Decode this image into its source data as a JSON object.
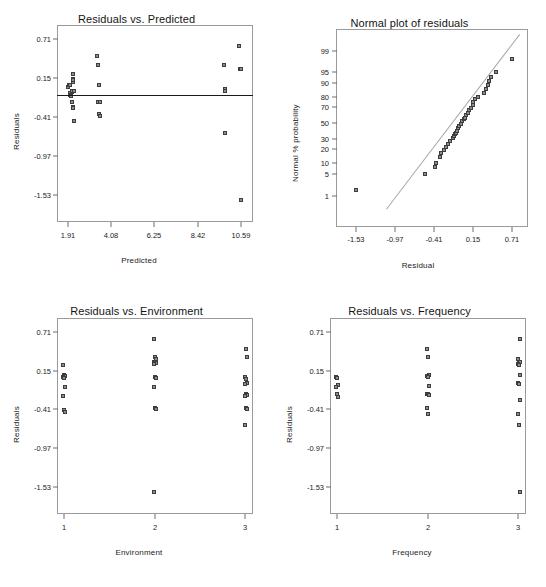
{
  "figure": {
    "width": 546,
    "height": 587,
    "background": "#ffffff",
    "marker_fill": "#8d8d8d",
    "marker_stroke": "#3d3d3d",
    "frame_color": "#9a9a9a",
    "zeroline_color": "#1a1a1a",
    "refline_color": "#a6a6a6"
  },
  "chart_data": [
    {
      "id": "residuals-vs-predicted",
      "type": "scatter",
      "title": "Residuals vs. Predicted",
      "xlabel": "Predicted",
      "ylabel": "Residuals",
      "xlim": [
        1.365,
        11.155
      ],
      "ylim": [
        -1.83,
        1.0
      ],
      "xticks": [
        1.91,
        4.08,
        6.25,
        8.42,
        10.59
      ],
      "xtick_labels": [
        "1.91",
        "4.08",
        "6.25",
        "8.42",
        "10.59"
      ],
      "yticks": [
        0.71,
        0.15,
        -0.41,
        -0.97,
        -1.53
      ],
      "ytick_labels": [
        "0.71",
        "0.15",
        "-0.41",
        "-0.97",
        "-1.53"
      ],
      "grid": false,
      "legend": null,
      "zero_reference_line": 0.0,
      "points": [
        [
          1.88,
          0.12
        ],
        [
          1.9,
          0.14
        ],
        [
          1.93,
          0.15
        ],
        [
          1.95,
          0.145
        ],
        [
          1.96,
          0.02
        ],
        [
          1.97,
          0.03
        ],
        [
          1.99,
          0.0
        ],
        [
          2.01,
          -0.02
        ],
        [
          2.05,
          0.04
        ],
        [
          2.07,
          0.05
        ],
        [
          2.1,
          0.3
        ],
        [
          2.12,
          0.19
        ],
        [
          2.13,
          0.23
        ],
        [
          2.14,
          0.21
        ],
        [
          2.15,
          0.05
        ],
        [
          2.18,
          0.06
        ],
        [
          2.05,
          -0.1
        ],
        [
          2.12,
          -0.18
        ],
        [
          2.14,
          -0.19
        ],
        [
          2.17,
          -0.38
        ],
        [
          3.35,
          0.56
        ],
        [
          3.38,
          0.44
        ],
        [
          3.42,
          0.15
        ],
        [
          3.4,
          -0.1
        ],
        [
          3.46,
          -0.1
        ],
        [
          3.48,
          -0.1
        ],
        [
          3.44,
          -0.27
        ],
        [
          3.46,
          -0.3
        ],
        [
          3.47,
          -0.31
        ],
        [
          9.75,
          0.44
        ],
        [
          9.78,
          0.09
        ],
        [
          9.8,
          0.06
        ],
        [
          9.78,
          -0.55
        ],
        [
          10.52,
          0.71
        ],
        [
          10.55,
          0.38
        ],
        [
          10.58,
          0.37
        ],
        [
          10.6,
          0.38
        ],
        [
          10.59,
          -1.53
        ]
      ]
    },
    {
      "id": "normal-plot-of-residuals",
      "type": "scatter",
      "title": "Normal plot of residuals",
      "xlabel": "Residual",
      "ylabel": "Normal % probability",
      "xlim": [
        -1.81,
        0.92
      ],
      "xticks": [
        -1.53,
        -0.97,
        -0.41,
        0.15,
        0.71
      ],
      "xtick_labels": [
        "-1.53",
        "-0.97",
        "-0.41",
        "0.15",
        "0.71"
      ],
      "yticks": [
        99,
        95,
        90,
        80,
        70,
        50,
        30,
        20,
        10,
        5,
        1
      ],
      "ytick_labels": [
        "99",
        "95",
        "90",
        "80",
        "70",
        "50",
        "30",
        "20",
        "10",
        "5",
        "1"
      ],
      "grid": false,
      "legend": null,
      "reference_line": {
        "x1": -1.1,
        "y1": 0.3,
        "x2": 0.82,
        "y2": 99.8
      },
      "points": [
        [
          -1.53,
          1.6
        ],
        [
          -0.55,
          5.0
        ],
        [
          -0.4,
          8.0
        ],
        [
          -0.39,
          10.0
        ],
        [
          -0.33,
          14.0
        ],
        [
          -0.31,
          16.5
        ],
        [
          -0.27,
          19.0
        ],
        [
          -0.25,
          22.0
        ],
        [
          -0.21,
          25.0
        ],
        [
          -0.19,
          28.0
        ],
        [
          -0.15,
          31.0
        ],
        [
          -0.13,
          34.0
        ],
        [
          -0.12,
          36.0
        ],
        [
          -0.1,
          38.0
        ],
        [
          -0.09,
          40.0
        ],
        [
          -0.07,
          43.0
        ],
        [
          -0.05,
          46.0
        ],
        [
          -0.03,
          49.0
        ],
        [
          -0.01,
          52.0
        ],
        [
          0.01,
          55.0
        ],
        [
          0.03,
          57.0
        ],
        [
          0.05,
          60.0
        ],
        [
          0.07,
          63.0
        ],
        [
          0.09,
          66.0
        ],
        [
          0.12,
          69.0
        ],
        [
          0.14,
          72.0
        ],
        [
          0.15,
          75.0
        ],
        [
          0.17,
          78.0
        ],
        [
          0.22,
          80.0
        ],
        [
          0.3,
          83.0
        ],
        [
          0.33,
          86.0
        ],
        [
          0.36,
          89.0
        ],
        [
          0.38,
          91.0
        ],
        [
          0.4,
          93.0
        ],
        [
          0.47,
          95.0
        ],
        [
          0.71,
          98.0
        ]
      ]
    },
    {
      "id": "residuals-vs-environment",
      "type": "scatter",
      "title": "Residuals vs. Environment",
      "xlabel": "Environment",
      "ylabel": "Residuals",
      "categories": [
        "1",
        "2",
        "3"
      ],
      "ylim": [
        -1.83,
        1.0
      ],
      "yticks": [
        0.71,
        0.15,
        -0.41,
        -0.97,
        -1.53
      ],
      "ytick_labels": [
        "0.71",
        "0.15",
        "-0.41",
        "-0.97",
        "-1.53"
      ],
      "grid": false,
      "legend": null,
      "zero_reference_line": 0.0,
      "points": [
        [
          1,
          0.33
        ],
        [
          1,
          0.19
        ],
        [
          1,
          0.17
        ],
        [
          1,
          0.15
        ],
        [
          1,
          0.14
        ],
        [
          1,
          0.01
        ],
        [
          1,
          -0.12
        ],
        [
          1,
          -0.33
        ],
        [
          1,
          -0.36
        ],
        [
          2,
          0.71
        ],
        [
          2,
          0.44
        ],
        [
          2,
          0.41
        ],
        [
          2,
          0.38
        ],
        [
          2,
          0.37
        ],
        [
          2,
          0.36
        ],
        [
          2,
          0.35
        ],
        [
          2,
          0.15
        ],
        [
          2,
          0.14
        ],
        [
          2,
          0.01
        ],
        [
          2,
          -0.3
        ],
        [
          2,
          -0.32
        ],
        [
          2,
          -1.53
        ],
        [
          3,
          0.56
        ],
        [
          3,
          0.44
        ],
        [
          3,
          0.16
        ],
        [
          3,
          0.13
        ],
        [
          3,
          0.07
        ],
        [
          3,
          0.05
        ],
        [
          3,
          -0.1
        ],
        [
          3,
          -0.11
        ],
        [
          3,
          -0.12
        ],
        [
          3,
          -0.3
        ],
        [
          3,
          -0.32
        ],
        [
          3,
          -0.55
        ]
      ]
    },
    {
      "id": "residuals-vs-frequency",
      "type": "scatter",
      "title": "Residuals vs. Frequency",
      "xlabel": "Frequency",
      "ylabel": "Residuals",
      "categories": [
        "1",
        "2",
        "3"
      ],
      "ylim": [
        -1.83,
        1.0
      ],
      "yticks": [
        0.71,
        0.15,
        -0.41,
        -0.97,
        -1.53
      ],
      "ytick_labels": [
        "0.71",
        "0.15",
        "-0.41",
        "-0.97",
        "-1.53"
      ],
      "grid": false,
      "legend": null,
      "zero_reference_line": 0.0,
      "points": [
        [
          1,
          0.15
        ],
        [
          1,
          0.14
        ],
        [
          1,
          0.03
        ],
        [
          1,
          0.01
        ],
        [
          1,
          -0.1
        ],
        [
          1,
          -0.14
        ],
        [
          2,
          0.56
        ],
        [
          2,
          0.44
        ],
        [
          2,
          0.19
        ],
        [
          2,
          0.17
        ],
        [
          2,
          0.15
        ],
        [
          2,
          0.02
        ],
        [
          2,
          -0.09
        ],
        [
          2,
          -0.1
        ],
        [
          2,
          -0.11
        ],
        [
          2,
          -0.3
        ],
        [
          2,
          -0.38
        ],
        [
          3,
          0.71
        ],
        [
          3,
          0.41
        ],
        [
          3,
          0.38
        ],
        [
          3,
          0.37
        ],
        [
          3,
          0.35
        ],
        [
          3,
          0.33
        ],
        [
          3,
          0.19
        ],
        [
          3,
          0.07
        ],
        [
          3,
          0.05
        ],
        [
          3,
          -0.18
        ],
        [
          3,
          -0.39
        ],
        [
          3,
          -0.55
        ],
        [
          3,
          -1.53
        ]
      ]
    }
  ]
}
